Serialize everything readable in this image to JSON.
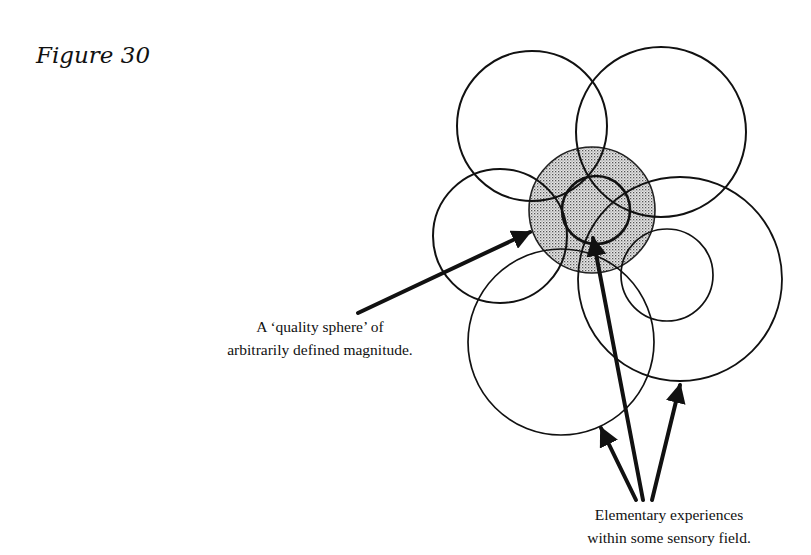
{
  "figure": {
    "title": "Figure 30"
  },
  "labels": {
    "sphere_line1": "A ‘quality sphere’ of",
    "sphere_line2": "arbitrarily defined magnitude.",
    "elementary_line1": "Elementary experiences",
    "elementary_line2": "within  some sensory field."
  },
  "colors": {
    "ink": "#111111",
    "shading": "#bdbdbd",
    "background": "#ffffff"
  },
  "diagram": {
    "quality_sphere": {
      "cx": 592,
      "cy": 210,
      "r": 63,
      "shaded": true
    },
    "circles": [
      {
        "name": "top-left",
        "cx": 532,
        "cy": 126,
        "r": 75
      },
      {
        "name": "top-right",
        "cx": 661,
        "cy": 132,
        "r": 85
      },
      {
        "name": "left-middle",
        "cx": 500,
        "cy": 236,
        "r": 67
      },
      {
        "name": "inner-small",
        "cx": 596,
        "cy": 210,
        "r": 34
      },
      {
        "name": "bottom-left-large",
        "cx": 561,
        "cy": 342,
        "r": 93
      },
      {
        "name": "right-large",
        "cx": 680,
        "cy": 279,
        "r": 102
      },
      {
        "name": "right-small",
        "cx": 667,
        "cy": 275,
        "r": 46
      }
    ],
    "arrows": [
      {
        "name": "sphere-pointer",
        "x1": 358,
        "y1": 313,
        "x2": 530,
        "y2": 232
      },
      {
        "name": "experience-pointer-left",
        "x1": 636,
        "y1": 500,
        "x2": 601,
        "y2": 428
      },
      {
        "name": "experience-pointer-center",
        "x1": 643,
        "y1": 500,
        "x2": 593,
        "y2": 238
      },
      {
        "name": "experience-pointer-right",
        "x1": 652,
        "y1": 500,
        "x2": 680,
        "y2": 385
      }
    ]
  }
}
